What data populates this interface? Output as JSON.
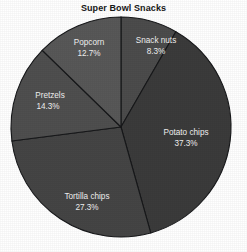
{
  "chart_data": {
    "type": "pie",
    "title": "Super Bowl Snacks",
    "subtitle": "",
    "xlabel": "",
    "ylabel": "",
    "legend": "none",
    "grid": false,
    "start_angle_deg": 0,
    "direction": "clockwise",
    "categories": [
      "Snack nuts",
      "Potato chips",
      "Tortilla chips",
      "Pretzels",
      "Popcorn"
    ],
    "values": [
      8.3,
      37.3,
      27.3,
      14.3,
      12.7
    ],
    "value_unit": "%",
    "slices": [
      {
        "label": "Snack nuts",
        "percent_text": "8.3%",
        "value": 8.3,
        "color": "#4c4c4c",
        "label_x": 156,
        "label_y": 41,
        "pct_x": 156,
        "pct_y": 52
      },
      {
        "label": "Potato chips",
        "percent_text": "37.3%",
        "value": 37.3,
        "color": "#3b3b3b",
        "label_x": 186,
        "label_y": 133,
        "pct_x": 186,
        "pct_y": 144
      },
      {
        "label": "Tortilla chips",
        "percent_text": "27.3%",
        "value": 27.3,
        "color": "#454545",
        "label_x": 87,
        "label_y": 197,
        "pct_x": 87,
        "pct_y": 208
      },
      {
        "label": "Pretzels",
        "percent_text": "14.3%",
        "value": 14.3,
        "color": "#4f4f4f",
        "label_x": 50,
        "label_y": 96,
        "pct_x": 48,
        "pct_y": 107
      },
      {
        "label": "Popcorn",
        "percent_text": "12.7%",
        "value": 12.7,
        "color": "#585858",
        "label_x": 89,
        "label_y": 43,
        "pct_x": 89,
        "pct_y": 54
      }
    ],
    "geometry": {
      "center_x": 121,
      "center_y": 127,
      "radius": 110
    },
    "colors": {
      "background": "#ffffff",
      "title_text": "#171717",
      "slice_label_text": "#f2f2f2",
      "slice_border": "#17181a"
    }
  }
}
